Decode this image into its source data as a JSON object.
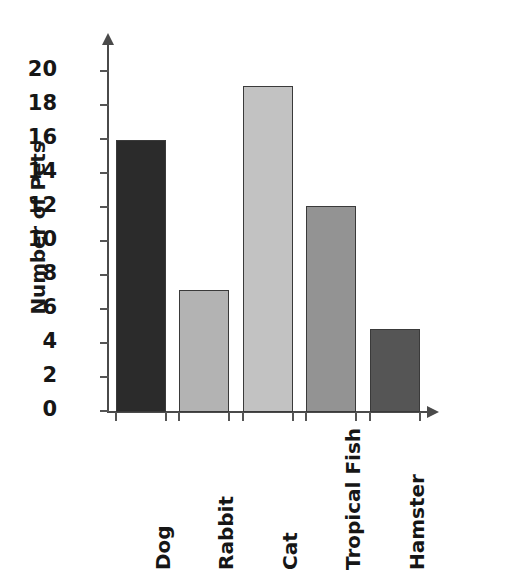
{
  "chart_data": {
    "type": "bar",
    "title": "",
    "xlabel": "",
    "ylabel": "Number of Pets",
    "categories": [
      "Dog",
      "Rabbit",
      "Cat",
      "Tropical Fish",
      "Hamster"
    ],
    "values": [
      16,
      7.2,
      19.2,
      12.1,
      4.9
    ],
    "bar_colors": [
      "#2b2b2b",
      "#b3b3b3",
      "#c2c2c2",
      "#939393",
      "#555555"
    ],
    "ylim": [
      0,
      21
    ],
    "ytick_labels": [
      "0",
      "2",
      "4",
      "6",
      "8",
      "10",
      "12",
      "14",
      "16",
      "18",
      "20"
    ],
    "ytick_values": [
      0,
      2,
      4,
      6,
      8,
      10,
      12,
      14,
      16,
      18,
      20
    ],
    "grid": false,
    "legend": null,
    "xlabel_rotation": -90,
    "axis_color": "#4a4a4a",
    "background_color": "#ffffff"
  },
  "axis": {
    "y_title": "Number of Pets"
  }
}
